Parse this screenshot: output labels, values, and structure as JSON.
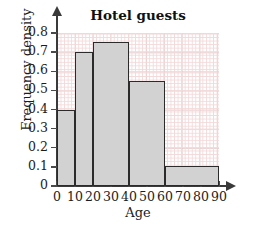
{
  "chart_data": {
    "type": "bar",
    "title": "Hotel guests",
    "xlabel": "Age",
    "ylabel": "Frequency density",
    "grid": true,
    "legend": false,
    "xlim": [
      0,
      90
    ],
    "ylim": [
      0,
      0.8
    ],
    "xticks": [
      0,
      10,
      20,
      30,
      40,
      50,
      60,
      70,
      80,
      90
    ],
    "xtick_labels": [
      "0",
      "10",
      "20",
      "30",
      "40",
      "50",
      "60",
      "70",
      "80",
      "90"
    ],
    "yticks": [
      0,
      0.1,
      0.2,
      0.3,
      0.4,
      0.5,
      0.6,
      0.7,
      0.8
    ],
    "ytick_labels": [
      "0",
      "0.1",
      "0.2",
      "0.3",
      "0.4",
      "0.5",
      "0.6",
      "0.7",
      "0.8"
    ],
    "categories": [
      "0-10",
      "10-20",
      "20-40",
      "40-60",
      "60-90"
    ],
    "values": [
      0.4,
      0.7,
      0.755,
      0.55,
      0.105
    ],
    "bins": [
      {
        "label": "0-10",
        "start": 0,
        "end": 10,
        "density": 0.4
      },
      {
        "label": "10-20",
        "start": 10,
        "end": 20,
        "density": 0.7
      },
      {
        "label": "20-40",
        "start": 20,
        "end": 40,
        "density": 0.755
      },
      {
        "label": "40-60",
        "start": 40,
        "end": 60,
        "density": 0.55
      },
      {
        "label": "60-90",
        "start": 60,
        "end": 90,
        "density": 0.105
      }
    ],
    "bar_fill": "#d2d2d2",
    "bar_edge": "#2b2b2b",
    "grid_color": "#f3dada",
    "axis_color": "#3a3a3a"
  }
}
